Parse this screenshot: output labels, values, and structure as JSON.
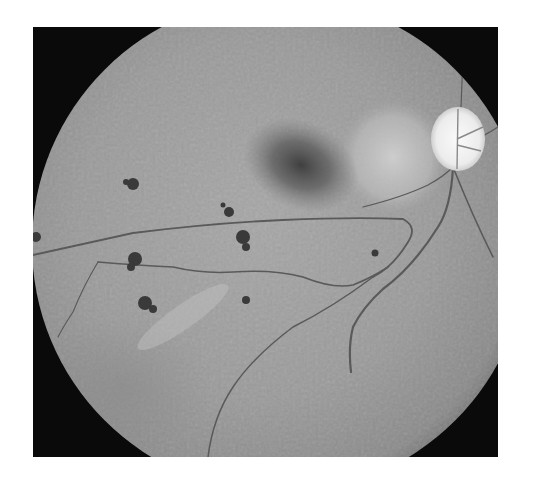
{
  "image": {
    "subject": "grayscale fundus photograph of retina",
    "frame": {
      "x": 33,
      "y": 27,
      "width": 465,
      "height": 430,
      "background": "#0a0a0a"
    },
    "fundus": {
      "cx": 247,
      "cy": 218,
      "r": 248,
      "base_color": "#9a9a9a"
    },
    "features": {
      "optic_disc": {
        "cx": 425,
        "cy": 112,
        "rx": 27,
        "ry": 32,
        "color": "#f2f2f2"
      },
      "peripapillary_pallor": {
        "cx": 360,
        "cy": 130,
        "rx": 55,
        "ry": 55,
        "color": "#c8c8c8"
      },
      "macula": {
        "cx": 270,
        "cy": 140,
        "rx": 55,
        "ry": 42,
        "color": "#3c3c3c"
      },
      "pigment_spots": [
        {
          "cx": 100,
          "cy": 157,
          "r": 6
        },
        {
          "cx": 196,
          "cy": 185,
          "r": 6
        },
        {
          "cx": 210,
          "cy": 210,
          "r": 8
        },
        {
          "cx": 102,
          "cy": 232,
          "r": 8
        },
        {
          "cx": 112,
          "cy": 276,
          "r": 9
        },
        {
          "cx": 213,
          "cy": 273,
          "r": 5
        },
        {
          "cx": 342,
          "cy": 226,
          "r": 4
        },
        {
          "cx": 3,
          "cy": 210,
          "r": 5
        }
      ],
      "vessel_color": "#5a5a5a"
    }
  }
}
